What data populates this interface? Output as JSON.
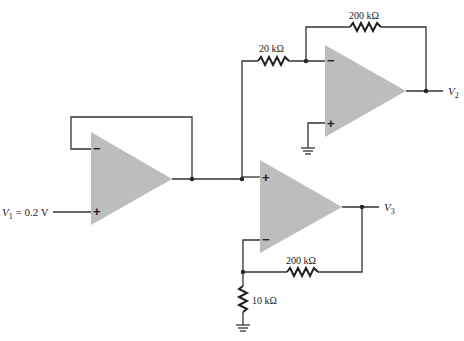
{
  "diagram": {
    "type": "op-amp circuit",
    "input": {
      "label": "V",
      "subscript": "1",
      "value_text": " = 0.2 V"
    },
    "outputs": [
      {
        "label": "V",
        "subscript": "2"
      },
      {
        "label": "V",
        "subscript": "3"
      }
    ],
    "resistors": [
      {
        "id": "r_in_top",
        "label": "20 kΩ"
      },
      {
        "id": "r_fb_top",
        "label": "200 kΩ"
      },
      {
        "id": "r_fb_bottom",
        "label": "200 kΩ"
      },
      {
        "id": "r_gnd_bottom",
        "label": "10 kΩ"
      }
    ],
    "opamps": [
      {
        "id": "buffer",
        "role": "voltage follower",
        "minus": "−",
        "plus": "+"
      },
      {
        "id": "inverting",
        "role": "inverting amplifier",
        "minus": "−",
        "plus": "+"
      },
      {
        "id": "noninverting",
        "role": "non-inverting amplifier",
        "minus": "−",
        "plus": "+"
      }
    ]
  }
}
